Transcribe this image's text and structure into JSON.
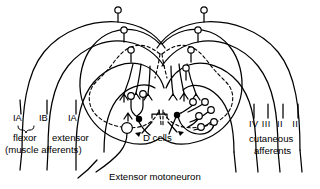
{
  "figure": {
    "type": "neuroanatomy-schematic",
    "background_color": "#ffffff",
    "stroke_color": "#000000"
  },
  "labels": {
    "left_afferent_classes": {
      "ia_flexor": "IA",
      "ib_flexor": "IB",
      "ia_extensor": "IA",
      "flexor": "flexor",
      "extensor": "extensor",
      "muscle_afferents": "(muscle afferents)"
    },
    "right_afferent_classes": {
      "classes": "IV III  II   II",
      "cutaneous": "cutaneous",
      "afferents": "afferents"
    },
    "center": {
      "d_cells": "D cells"
    },
    "callout": {
      "extensor_motoneuron": "Extensor motoneuron"
    }
  },
  "structures": {
    "gray_matter": "dashed butterfly outline",
    "white_matter": "solid cord outline",
    "left_arcs": 4,
    "right_arcs": 4,
    "interneurons_left": 3,
    "interneurons_right": 6,
    "filled_terminals": 2,
    "motoneuron": "large open circle with axon"
  },
  "icons": {
    "terminal_bouton": "open-circle-terminal",
    "inhibitory_terminal": "filled-circle-terminal",
    "arrowhead": "arrow-pointer",
    "brace": "curly-brace"
  }
}
